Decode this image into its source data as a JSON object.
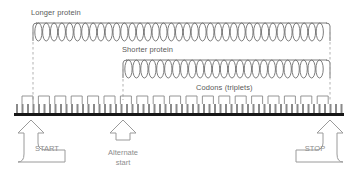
{
  "diagram": {
    "title_longer_protein": "Longer protein",
    "title_shorter_protein": "Shorter protein",
    "codons_label": "Codons (triplets)",
    "start_label": "START",
    "alternate_start_label": "Alternate\nstart",
    "stop_label": "STOP",
    "colors": {
      "strand": "#161616",
      "tick": "#8a8a8a",
      "coil": "#6e6e6e",
      "bracket": "#8a8a8a",
      "arrow_outline": "#9a9a9a",
      "text": "#5a5a5a",
      "box_text": "#8d8d8d",
      "dashed": "#a8a8a8",
      "background": "#ffffff"
    },
    "strand": {
      "x_start": 14,
      "x_end": 344,
      "baseline_y": 113,
      "bar_height": 3,
      "tick_count": 60,
      "tick_height": 9,
      "tick_width": 2
    },
    "codon_brackets": {
      "count": 19,
      "first_x": 22,
      "spacing": 16.4,
      "width": 11,
      "top_y": 96,
      "bottom_y": 104
    },
    "longer_protein_coil": {
      "x_left": 33,
      "x_right": 330,
      "y": 32,
      "loops": 38,
      "amplitude": 9
    },
    "shorter_protein_coil": {
      "x_left": 123,
      "x_right": 330,
      "y": 69,
      "loops": 26,
      "amplitude": 9
    },
    "connectors": [
      {
        "name": "longer-protein-left-drop",
        "x": 33,
        "y_top": 32,
        "y_bottom": 100
      },
      {
        "name": "shorter-protein-left-drop",
        "x": 123,
        "y_top": 69,
        "y_bottom": 100
      },
      {
        "name": "proteins-right-drop",
        "x": 330,
        "y_top": 32,
        "y_bottom": 100
      }
    ],
    "callouts": [
      {
        "name": "start",
        "label": "START",
        "arrow_x": 31,
        "arrow_tip_y": 120,
        "direction": "right"
      },
      {
        "name": "alternate-start",
        "label": "Alternate\nstart",
        "arrow_x": 123,
        "arrow_tip_y": 120,
        "direction": "straight"
      },
      {
        "name": "stop",
        "label": "STOP",
        "arrow_x": 330,
        "arrow_tip_y": 120,
        "direction": "left"
      }
    ]
  }
}
